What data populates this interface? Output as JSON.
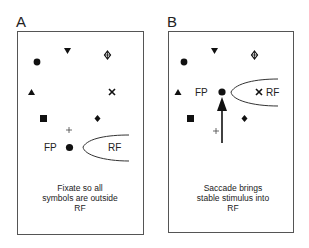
{
  "panels": [
    {
      "id": "A",
      "letter": "A",
      "fp_label": "FP",
      "rf_label": "RF",
      "caption": [
        "Fixate so all",
        "symbols are outside",
        "RF"
      ]
    },
    {
      "id": "B",
      "letter": "B",
      "fp_label": "FP",
      "rf_label": "RF",
      "caption": [
        "Saccade brings",
        "stable stimulus into",
        "RF"
      ]
    }
  ],
  "symbols": [
    "filled-circle",
    "down-triangle",
    "open-diamond-cross",
    "up-triangle",
    "x-cross",
    "filled-square",
    "filled-diamond",
    "plus"
  ],
  "colors": {
    "stroke": "#333333",
    "fill": "#111111",
    "border": "#555555",
    "background": "#ffffff"
  }
}
